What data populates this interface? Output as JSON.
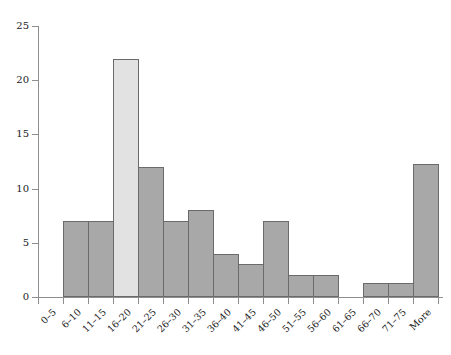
{
  "chart_data": {
    "type": "bar",
    "title": "",
    "subtitle": "",
    "xlabel": "",
    "ylabel": "",
    "ylim": [
      0,
      25
    ],
    "ytick_values": [
      0,
      5,
      10,
      15,
      20,
      25
    ],
    "ytick_labels": [
      "0",
      "5",
      "10",
      "15",
      "20",
      "25"
    ],
    "grid": false,
    "legend": null,
    "categories": [
      "0–5",
      "6–10",
      "11–15",
      "16–20",
      "21–25",
      "26–30",
      "31–35",
      "36–40",
      "41–45",
      "46–50",
      "51–55",
      "56–60",
      "61–65",
      "66–70",
      "71–75",
      "More"
    ],
    "values": [
      0,
      7,
      7,
      22,
      12,
      7,
      8,
      4,
      3,
      7,
      2,
      2,
      0,
      1.3,
      1.3,
      12.3
    ],
    "highlight_index": 3,
    "bar_colors": {
      "default": "#a8a8a8",
      "highlight": "#e2e2e2",
      "border": "#6b6b6b"
    },
    "axis_color": "#8e8e8e",
    "background": "#ffffff"
  }
}
